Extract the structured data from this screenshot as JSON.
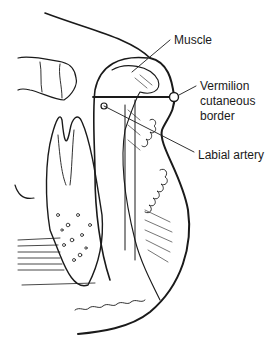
{
  "diagram": {
    "labels": {
      "muscle": "Muscle",
      "vermilion_line1": "Vermilion",
      "vermilion_line2": "cutaneous",
      "vermilion_line3": "border",
      "labial_artery": "Labial artery"
    },
    "colors": {
      "ink": "#1a1a1a",
      "background": "#ffffff"
    }
  }
}
